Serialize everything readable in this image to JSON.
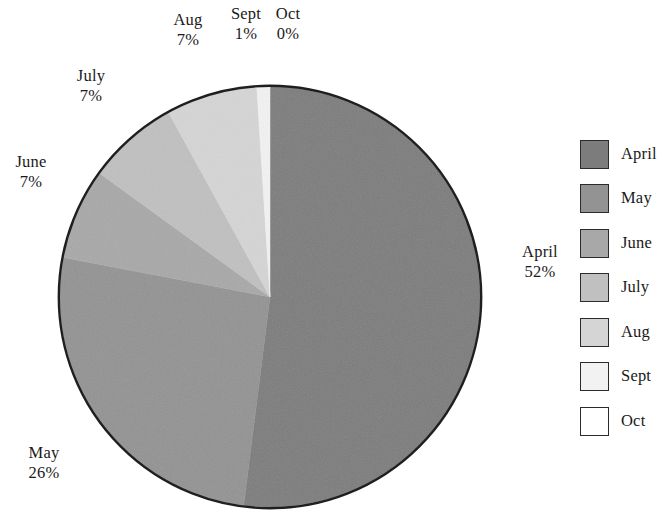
{
  "chart_data": {
    "type": "pie",
    "title": "",
    "categories": [
      "April",
      "May",
      "June",
      "July",
      "Aug",
      "Sept",
      "Oct"
    ],
    "values": [
      52,
      26,
      7,
      7,
      7,
      1,
      0
    ],
    "value_unit": "%",
    "start_angle_deg": 0,
    "direction": "clockwise",
    "legend_position": "right",
    "grid": false,
    "slice_colors": [
      "#7c7c7c",
      "#939393",
      "#a8a8a8",
      "#c0c0c0",
      "#d5d5d5",
      "#f2f2f2",
      "#ffffff"
    ],
    "outline_color": "#1f1f1f",
    "slices": [
      {
        "label": "April",
        "value": 52,
        "percent_text": "52%",
        "color": "#7c7c7c"
      },
      {
        "label": "May",
        "value": 26,
        "percent_text": "26%",
        "color": "#939393"
      },
      {
        "label": "June",
        "value": 7,
        "percent_text": "7%",
        "color": "#a8a8a8"
      },
      {
        "label": "July",
        "value": 7,
        "percent_text": "7%",
        "color": "#c0c0c0"
      },
      {
        "label": "Aug",
        "value": 7,
        "percent_text": "7%",
        "color": "#d5d5d5"
      },
      {
        "label": "Sept",
        "value": 1,
        "percent_text": "1%",
        "color": "#f2f2f2"
      },
      {
        "label": "Oct",
        "value": 0,
        "percent_text": "0%",
        "color": "#ffffff"
      }
    ]
  },
  "callouts": {
    "april": {
      "name": "April",
      "percent": "52%"
    },
    "may": {
      "name": "May",
      "percent": "26%"
    },
    "june": {
      "name": "June",
      "percent": "7%"
    },
    "july": {
      "name": "July",
      "percent": "7%"
    },
    "aug": {
      "name": "Aug",
      "percent": "7%"
    },
    "sept": {
      "name": "Sept",
      "percent": "1%"
    },
    "oct": {
      "name": "Oct",
      "percent": "0%"
    }
  },
  "legend": {
    "items": [
      {
        "label": "April",
        "color": "#7c7c7c"
      },
      {
        "label": "May",
        "color": "#939393"
      },
      {
        "label": "June",
        "color": "#a8a8a8"
      },
      {
        "label": "July",
        "color": "#c0c0c0"
      },
      {
        "label": "Aug",
        "color": "#d5d5d5"
      },
      {
        "label": "Sept",
        "color": "#f2f2f2"
      },
      {
        "label": "Oct",
        "color": "#ffffff"
      }
    ]
  }
}
